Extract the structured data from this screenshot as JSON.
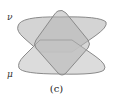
{
  "diagram": {
    "labels": {
      "upper": "ν",
      "lower": "μ"
    },
    "caption": "(c)",
    "colors": {
      "fill": "#c8c8c8",
      "overlap_fill": "#b0b0b0",
      "stroke": "#8a8a8a",
      "background": "#ffffff"
    },
    "shapes": [
      {
        "name": "nu",
        "description": "upper wide lens shape tapering downward"
      },
      {
        "name": "mu",
        "description": "lower wide lens shape tapering upward"
      },
      {
        "name": "diamond",
        "description": "rotated rounded square overlapping both"
      }
    ]
  }
}
